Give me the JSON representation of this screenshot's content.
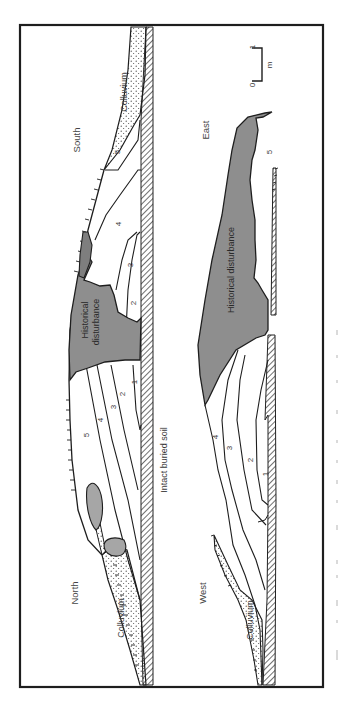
{
  "figure": {
    "type": "stratigraphic-section-diagram",
    "orientation": "rotated-90-ccw",
    "colors": {
      "frame": "#1e1e1e",
      "disturbance_fill": "#8e8e8e",
      "disturbance_fill_light": "#a6a6a6",
      "line": "#1e1e1e",
      "background": "#ffffff"
    },
    "scale_bar": {
      "zero": "0",
      "one": "1",
      "unit": "m"
    },
    "panels": [
      {
        "id": "north-south",
        "end_labels": {
          "left": "North",
          "right": "South"
        },
        "base_label": "Intact buried soil",
        "colluvium_labels": [
          "Colluvium",
          "Colluvium"
        ],
        "disturbance_labels": [
          "Historical",
          "disturbance"
        ],
        "layers_left_of_disturbance": [
          "5",
          "4",
          "3",
          "2",
          "1"
        ],
        "layers_right_of_disturbance": [
          "2",
          "3",
          "4",
          "5"
        ]
      },
      {
        "id": "west-east",
        "end_labels": {
          "left": "West",
          "right": "East"
        },
        "colluvium_labels": [
          "Colluvium"
        ],
        "disturbance_label": "Historical disturbance",
        "layers": [
          "4",
          "3",
          "2",
          "1",
          "5"
        ]
      }
    ],
    "caption": "Figure 5.7 (faded, illegible)"
  }
}
